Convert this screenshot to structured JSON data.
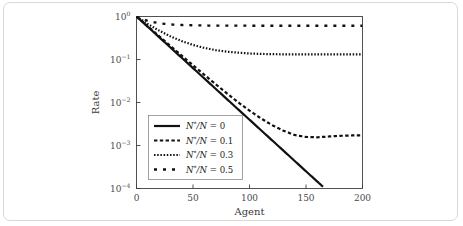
{
  "chart_data": {
    "type": "line",
    "title": "",
    "xlabel": "Agent",
    "ylabel": "Rate",
    "xlim": [
      0,
      200
    ],
    "ylim": [
      0.0001,
      1
    ],
    "yscale": "log",
    "xticks": [
      0,
      50,
      100,
      150,
      200
    ],
    "xtick_labels": [
      "0",
      "50",
      "100",
      "150",
      "200"
    ],
    "yticks": [
      1,
      0.1,
      0.01,
      0.001,
      0.0001
    ],
    "ytick_labels": [
      "10 0",
      "10 -1",
      "10 -2",
      "10 -3",
      "10 -4"
    ],
    "grid": false,
    "legend_position": "lower left inside axes",
    "series": [
      {
        "name": "N*/N = 0",
        "style": "solid",
        "x": [
          0,
          10,
          20,
          30,
          40,
          50,
          60,
          70,
          80,
          90,
          100,
          110,
          120,
          130,
          140,
          150,
          160,
          165
        ],
        "y": [
          1.0,
          0.5754,
          0.3311,
          0.1905,
          0.1096,
          0.0631,
          0.0363,
          0.0209,
          0.012,
          0.0069,
          0.00398,
          0.00229,
          0.00132,
          0.00076,
          0.000437,
          0.000251,
          0.000145,
          0.00011
        ]
      },
      {
        "name": "N*/N = 0.1",
        "style": "dashed",
        "x": [
          0,
          10,
          20,
          30,
          40,
          50,
          60,
          70,
          80,
          90,
          100,
          110,
          120,
          130,
          140,
          150,
          160,
          170,
          180,
          190,
          200
        ],
        "y": [
          1.0,
          0.59,
          0.35,
          0.207,
          0.123,
          0.0735,
          0.0441,
          0.0267,
          0.0163,
          0.0101,
          0.00646,
          0.00428,
          0.00298,
          0.00221,
          0.00175,
          0.00158,
          0.00155,
          0.00162,
          0.00168,
          0.00171,
          0.00172
        ]
      },
      {
        "name": "N*/N = 0.3",
        "style": "dotted",
        "x": [
          0,
          10,
          20,
          30,
          40,
          50,
          60,
          70,
          80,
          90,
          100,
          110,
          120,
          130,
          140,
          150,
          160,
          170,
          180,
          190,
          200
        ],
        "y": [
          1.0,
          0.67,
          0.47,
          0.345,
          0.268,
          0.218,
          0.186,
          0.165,
          0.152,
          0.144,
          0.138,
          0.135,
          0.133,
          0.132,
          0.131,
          0.131,
          0.131,
          0.131,
          0.131,
          0.131,
          0.131
        ]
      },
      {
        "name": "N*/N = 0.5",
        "style": "longdash",
        "x": [
          0,
          10,
          20,
          30,
          40,
          50,
          60,
          70,
          80,
          90,
          100,
          110,
          120,
          130,
          140,
          150,
          160,
          170,
          180,
          190,
          200
        ],
        "y": [
          1.0,
          0.79,
          0.695,
          0.655,
          0.635,
          0.624,
          0.618,
          0.614,
          0.612,
          0.611,
          0.61,
          0.61,
          0.61,
          0.61,
          0.61,
          0.61,
          0.61,
          0.61,
          0.61,
          0.61,
          0.61
        ]
      }
    ],
    "legend": [
      {
        "label_prefix": "N",
        "label_star": "*",
        "label_mid": "/N = ",
        "value": "0"
      },
      {
        "label_prefix": "N",
        "label_star": "*",
        "label_mid": "/N = ",
        "value": "0.1"
      },
      {
        "label_prefix": "N",
        "label_star": "*",
        "label_mid": "/N = ",
        "value": "0.3"
      },
      {
        "label_prefix": "N",
        "label_star": "*",
        "label_mid": "/N = ",
        "value": "0.5"
      }
    ]
  },
  "colors": {
    "line": "#111111",
    "axis": "#3f3f3f",
    "page_border": "#d8d8d8",
    "background": "#ffffff"
  }
}
